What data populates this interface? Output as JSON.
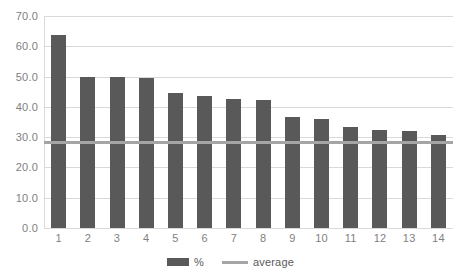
{
  "chart_data": {
    "type": "bar",
    "title": "",
    "subtitle": "",
    "xlabel": "",
    "ylabel": "",
    "categories": [
      "1",
      "2",
      "3",
      "4",
      "5",
      "6",
      "7",
      "8",
      "9",
      "10",
      "11",
      "12",
      "13",
      "14"
    ],
    "series": [
      {
        "name": "%",
        "type": "bar",
        "color": "#595959",
        "values": [
          63.8,
          50.0,
          49.8,
          49.4,
          44.6,
          43.6,
          42.6,
          42.2,
          36.8,
          36.0,
          33.4,
          32.2,
          32.0,
          30.7
        ]
      },
      {
        "name": "average",
        "type": "line",
        "color": "#a5a5a5",
        "value": 28.5
      }
    ],
    "ylim": [
      0.0,
      70.0
    ],
    "ytick_step": 10.0,
    "yticks": [
      "70.0",
      "60.0",
      "50.0",
      "40.0",
      "30.0",
      "20.0",
      "10.0",
      "0.0"
    ],
    "ytick_values": [
      70.0,
      60.0,
      50.0,
      40.0,
      30.0,
      20.0,
      10.0,
      0.0
    ],
    "grid": true,
    "grid_color": "#d9d9d9",
    "legend_position": "bottom",
    "legend": [
      {
        "label": "%",
        "marker": "bar-swatch",
        "color": "#595959"
      },
      {
        "label": "average",
        "marker": "line-swatch",
        "color": "#a5a5a5"
      }
    ],
    "background": "#ffffff"
  }
}
